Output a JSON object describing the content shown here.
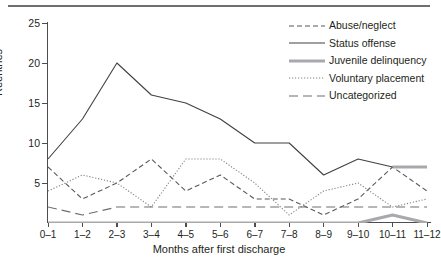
{
  "chart_data": {
    "type": "line",
    "title": "",
    "xlabel": "Months after first discharge",
    "ylabel": "Reentries",
    "categories": [
      "0–1",
      "1–2",
      "2–3",
      "3–4",
      "4–5",
      "5–6",
      "6–7",
      "7–8",
      "8–9",
      "9–10",
      "10–11",
      "11–12"
    ],
    "ylim": [
      0,
      25
    ],
    "yticks": [
      0,
      5,
      10,
      15,
      20,
      25
    ],
    "ytick_labels": [
      "",
      "5",
      "10",
      "15",
      "20",
      "25"
    ],
    "grid": false,
    "legend_position": "top-right",
    "series": [
      {
        "name": "Abuse/neglect",
        "style": "dashed",
        "color": "#58595b",
        "values": [
          7,
          3,
          5,
          8,
          4,
          6,
          3,
          3,
          1,
          3,
          7,
          4
        ]
      },
      {
        "name": "Status offense",
        "style": "solid",
        "color": "#414042",
        "values": [
          8,
          13,
          20,
          16,
          15,
          13,
          10,
          10,
          6,
          8,
          7,
          7
        ]
      },
      {
        "name": "Juvenile delinquency",
        "style": "thick",
        "color": "#a7a9ac",
        "values": [
          0,
          0,
          0,
          0,
          0,
          0,
          0,
          0,
          0,
          0,
          1,
          0
        ]
      },
      {
        "name": "Voluntary placement",
        "style": "dotted",
        "color": "#808285",
        "values": [
          4,
          6,
          5,
          2,
          8,
          8,
          5,
          1,
          4,
          5,
          2,
          3
        ]
      },
      {
        "name": "Uncategorized",
        "style": "longdash",
        "color": "#6d6e71",
        "values": [
          2,
          1,
          2,
          2,
          2,
          2,
          2,
          2,
          2,
          2,
          2,
          2
        ]
      }
    ]
  },
  "legend": {
    "items": [
      {
        "label": "Abuse/neglect",
        "icon": "dashed-line-icon"
      },
      {
        "label": "Status offense",
        "icon": "solid-line-icon"
      },
      {
        "label": "Juvenile delinquency",
        "icon": "thick-line-icon"
      },
      {
        "label": "Voluntary placement",
        "icon": "dotted-line-icon"
      },
      {
        "label": "Uncategorized",
        "icon": "long-dashed-line-icon"
      }
    ]
  },
  "axes": {
    "y_title": "Reentries",
    "x_title": "Months after first discharge",
    "y_tick_labels": [
      "25",
      "20",
      "15",
      "10",
      "5"
    ],
    "x_tick_labels": [
      "0–1",
      "1–2",
      "2–3",
      "3–4",
      "4–5",
      "5–6",
      "6–7",
      "7–8",
      "8–9",
      "9–10",
      "10–11",
      "11–12"
    ]
  },
  "colors": {
    "rule": "#6d6e71",
    "axis": "#4d4d4f",
    "abuse": "#58595b",
    "status": "#414042",
    "juvenile": "#a7a9ac",
    "voluntary": "#808285",
    "uncategorized": "#6d6e71"
  }
}
